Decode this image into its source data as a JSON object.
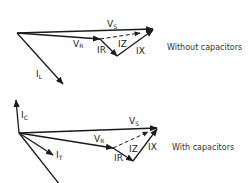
{
  "diagrams": [
    {
      "caption": "Without capacitors",
      "labels": {
        "vs": "V",
        "vs_sub": "S",
        "vr": "V",
        "vr_sub": "R",
        "ir": "IR",
        "iz": "IZ",
        "ix": "IX",
        "il": "I",
        "il_sub": "L"
      }
    },
    {
      "caption": "With capacitors",
      "labels": {
        "ic": "I",
        "ic_sub": "C",
        "vs": "V",
        "vs_sub": "S",
        "vr": "V",
        "vr_sub": "R",
        "ir": "IR",
        "iz": "IZ",
        "ix": "IX",
        "it": "I",
        "it_sub": "T"
      }
    }
  ]
}
